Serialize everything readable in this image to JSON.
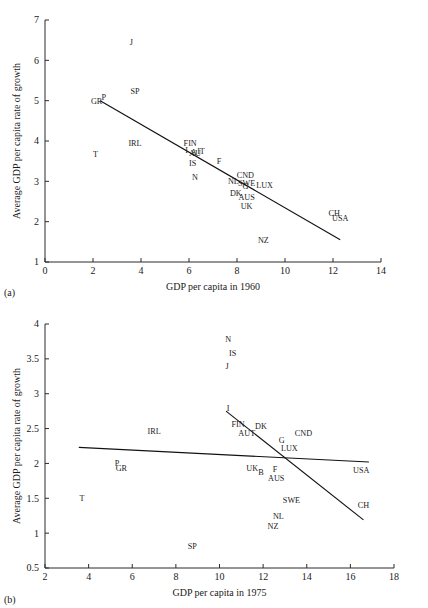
{
  "figure": {
    "panels": [
      {
        "tag": "(a)",
        "xlabel": "GDP per capita in 1960",
        "ylabel": "Average GDP per capita rate of growth"
      },
      {
        "tag": "(b)",
        "xlabel": "GDP per capita in 1975",
        "ylabel": "Average GDP per capita rate of growth"
      }
    ]
  },
  "chart_data": [
    {
      "type": "scatter",
      "title": "",
      "xlabel": "GDP per capita in 1960",
      "ylabel": "Average GDP per capita rate of growth",
      "xlim": [
        0,
        14
      ],
      "ylim": [
        1,
        7
      ],
      "xticks": [
        0,
        2,
        4,
        6,
        8,
        10,
        12,
        14
      ],
      "yticks": [
        1,
        2,
        3,
        4,
        5,
        6,
        7
      ],
      "grid": false,
      "legend": "none",
      "point_labels_only": true,
      "points": [
        {
          "label": "J",
          "x": 3.6,
          "y": 6.45
        },
        {
          "label": "SP",
          "x": 3.75,
          "y": 5.25
        },
        {
          "label": "P",
          "x": 2.45,
          "y": 5.1
        },
        {
          "label": "GR",
          "x": 2.15,
          "y": 4.98
        },
        {
          "label": "IRL",
          "x": 3.75,
          "y": 3.95
        },
        {
          "label": "T",
          "x": 2.1,
          "y": 3.68
        },
        {
          "label": "FIN",
          "x": 6.05,
          "y": 3.96
        },
        {
          "label": "I",
          "x": 5.9,
          "y": 3.78
        },
        {
          "label": "A",
          "x": 6.2,
          "y": 3.72
        },
        {
          "label": "AU",
          "x": 6.25,
          "y": 3.7
        },
        {
          "label": "IT",
          "x": 6.5,
          "y": 3.76
        },
        {
          "label": "IS",
          "x": 6.15,
          "y": 3.45
        },
        {
          "label": "F",
          "x": 7.25,
          "y": 3.5
        },
        {
          "label": "N",
          "x": 6.25,
          "y": 3.1
        },
        {
          "label": "CND",
          "x": 8.35,
          "y": 3.15
        },
        {
          "label": "NL",
          "x": 7.85,
          "y": 3.02
        },
        {
          "label": "SWE",
          "x": 8.4,
          "y": 2.95
        },
        {
          "label": "G",
          "x": 8.35,
          "y": 2.88
        },
        {
          "label": "LUX",
          "x": 9.15,
          "y": 2.92
        },
        {
          "label": "DK",
          "x": 7.95,
          "y": 2.72
        },
        {
          "label": "AUS",
          "x": 8.4,
          "y": 2.62
        },
        {
          "label": "UK",
          "x": 8.4,
          "y": 2.38
        },
        {
          "label": "CH",
          "x": 12.05,
          "y": 2.22
        },
        {
          "label": "USA",
          "x": 12.3,
          "y": 2.08
        },
        {
          "label": "NZ",
          "x": 9.1,
          "y": 1.55
        }
      ],
      "fit_lines": [
        {
          "name": "regression",
          "x0": 2.3,
          "y0": 5.0,
          "x1": 12.3,
          "y1": 1.55
        }
      ]
    },
    {
      "type": "scatter",
      "title": "",
      "xlabel": "GDP per capita in 1975",
      "ylabel": "Average GDP per capita rate of growth",
      "xlim": [
        2,
        18
      ],
      "ylim": [
        0.5,
        4
      ],
      "xticks": [
        2,
        4,
        6,
        8,
        10,
        12,
        14,
        16,
        18
      ],
      "yticks": [
        0.5,
        1,
        1.5,
        2,
        2.5,
        3,
        3.5,
        4
      ],
      "grid": false,
      "legend": "none",
      "point_labels_only": true,
      "points": [
        {
          "label": "N",
          "x": 10.4,
          "y": 3.78
        },
        {
          "label": "IS",
          "x": 10.6,
          "y": 3.58
        },
        {
          "label": "J",
          "x": 10.35,
          "y": 3.4
        },
        {
          "label": "I",
          "x": 10.4,
          "y": 2.79
        },
        {
          "label": "FIN",
          "x": 10.85,
          "y": 2.57
        },
        {
          "label": "DK",
          "x": 11.9,
          "y": 2.53
        },
        {
          "label": "AUT",
          "x": 11.25,
          "y": 2.43
        },
        {
          "label": "IRL",
          "x": 7.0,
          "y": 2.47
        },
        {
          "label": "G",
          "x": 12.85,
          "y": 2.34
        },
        {
          "label": "CND",
          "x": 13.85,
          "y": 2.44
        },
        {
          "label": "LUX",
          "x": 13.2,
          "y": 2.22
        },
        {
          "label": "P",
          "x": 5.3,
          "y": 2.0
        },
        {
          "label": "GR",
          "x": 5.5,
          "y": 1.93
        },
        {
          "label": "UK",
          "x": 11.5,
          "y": 1.93
        },
        {
          "label": "B",
          "x": 11.9,
          "y": 1.88
        },
        {
          "label": "F",
          "x": 12.55,
          "y": 1.92
        },
        {
          "label": "USA",
          "x": 16.5,
          "y": 1.9
        },
        {
          "label": "AUS",
          "x": 12.6,
          "y": 1.79
        },
        {
          "label": "T",
          "x": 3.7,
          "y": 1.5
        },
        {
          "label": "SWE",
          "x": 13.3,
          "y": 1.48
        },
        {
          "label": "CH",
          "x": 16.6,
          "y": 1.4
        },
        {
          "label": "NL",
          "x": 12.7,
          "y": 1.24
        },
        {
          "label": "NZ",
          "x": 12.45,
          "y": 1.1
        },
        {
          "label": "SP",
          "x": 8.75,
          "y": 0.82
        }
      ],
      "fit_lines": [
        {
          "name": "flat-regression",
          "x0": 3.55,
          "y0": 2.23,
          "x1": 16.85,
          "y1": 2.02
        },
        {
          "name": "steep-regression",
          "x0": 10.3,
          "y0": 2.75,
          "x1": 16.6,
          "y1": 1.19
        }
      ]
    }
  ]
}
